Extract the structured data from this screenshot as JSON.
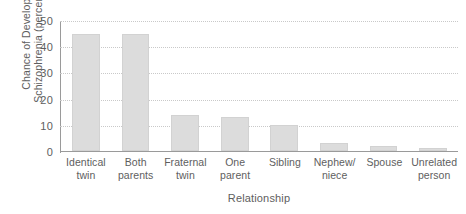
{
  "chart_data": {
    "type": "bar",
    "title": "",
    "subtitle": "",
    "xlabel": "Relationship",
    "ylabel_lines": [
      "Chance of Developing",
      "Schizophrenia (percentage)"
    ],
    "ylabel": "Chance of Developing Schizophrenia (percentage)",
    "categories": [
      "Identical twin",
      "Both parents",
      "Fraternal twin",
      "One parent",
      "Sibling",
      "Nephew/ niece",
      "Spouse",
      "Unrelated person"
    ],
    "category_lines": [
      [
        "Identical",
        "twin"
      ],
      [
        "Both",
        "parents"
      ],
      [
        "Fraternal",
        "twin"
      ],
      [
        "One",
        "parent"
      ],
      [
        "Sibling",
        ""
      ],
      [
        "Nephew/",
        "niece"
      ],
      [
        "Spouse",
        ""
      ],
      [
        "Unrelated",
        "person"
      ]
    ],
    "values": [
      45,
      45,
      14,
      13,
      10,
      3,
      2,
      1
    ],
    "ylim": [
      0,
      50
    ],
    "yticks": [
      0,
      10,
      20,
      30,
      40,
      50
    ],
    "ytick_labels": [
      "0",
      "10",
      "20",
      "30",
      "40",
      "50"
    ],
    "grid": true,
    "grid_style": "dotted-horizontal",
    "legend": false,
    "legend_position": "none",
    "bar_color": "#dcdcdc",
    "bar_edge_color": "#d2d2d2",
    "axis_color": "#9a9a9a",
    "grid_color": "#c9c9c9",
    "text_color": "#5e5e5e",
    "background": "#ffffff"
  }
}
